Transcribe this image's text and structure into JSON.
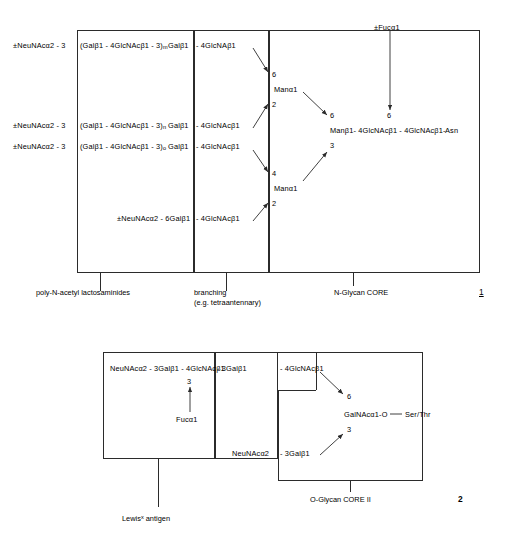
{
  "figure1": {
    "number": "1",
    "core_label": "N-Glycan CORE",
    "branching_label_line1": "branching",
    "branching_label_line2": "(e.g. tetraantennary)",
    "polylactosamine_label": "poly-N-acetyl lactosaminides",
    "fucose": "±Fucα1",
    "chains": [
      {
        "left": "±NeuNAcα2 - 3",
        "repeat_open": "(Galβ1 - 4GlcNAcβ1 - 3)",
        "repeat_sub": "m",
        "gal": "Galβ1",
        "glcnac": "- 4GlcNAβ1"
      },
      {
        "left": "±NeuNAcα2 - 3",
        "repeat_open": "(Galβ1 - 4GlcNAcβ1 - 3)",
        "repeat_sub": "n",
        "gal": "Galβ1",
        "glcnac": "- 4GlcNAcβ1"
      },
      {
        "left": "±NeuNAcα2 - 3",
        "repeat_open": "(Galβ1 - 4GlcNAcβ1 - 3)",
        "repeat_sub": "o",
        "gal": "Galβ1",
        "glcnac": "- 4GlcNAcβ1"
      }
    ],
    "sixlinked_chain": {
      "left": "±NeuNAcα2 - 6Galβ1",
      "glcnac": "- 4GlcNAcβ1"
    },
    "mannose_upper": "Manα1",
    "mannose_lower": "Manα1",
    "mannose_upper_positions": {
      "top": "6",
      "bottom": "2"
    },
    "mannose_lower_positions": {
      "top": "4",
      "bottom": "2"
    },
    "core_positions": {
      "upper": "6",
      "lower": "3",
      "fucose": "6"
    },
    "core_chain": "Manβ1- 4GlcNAcβ1 - 4GlcNAcβ1-",
    "asn": "Asn"
  },
  "figure2": {
    "number": "2",
    "core_label": "O-Glycan CORE II",
    "lewis_label_pre": "Lewis",
    "lewis_label_sup": "x",
    "lewis_label_post": " antigen",
    "upper_chain_part1": "NeuNAcα2 - 3Galβ1 - 4GlcNAcβ1",
    "upper_chain_part2": "- 3Galβ1",
    "upper_chain_part3": "- 4GlcNAcβ1",
    "fucose_position": "3",
    "fucose": "Fucα1",
    "lower_chain": "NeuNAcα2",
    "lower_chain_part2": "- 3Galβ1",
    "galnac": "GalNAcα1-O",
    "serthr": "Ser/Thr",
    "positions": {
      "upper": "6",
      "lower": "3"
    }
  },
  "colors": {
    "ink": "#2b2b2b",
    "text": "#000000"
  }
}
